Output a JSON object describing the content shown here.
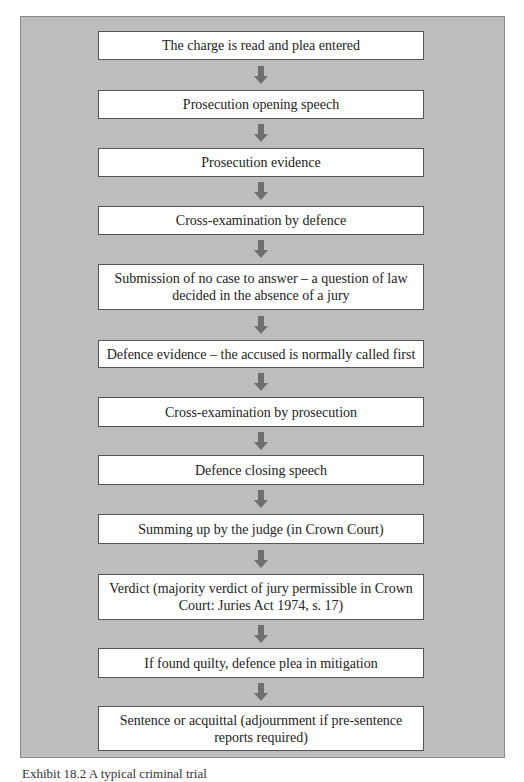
{
  "diagram": {
    "type": "flowchart",
    "direction": "top-to-bottom",
    "colors": {
      "panel_background": "#bdbdbd",
      "box_background": "#ffffff",
      "box_border": "#555555",
      "arrow": "#6f6f6f",
      "text": "#222222"
    },
    "steps": [
      {
        "label": "The charge is read and plea entered"
      },
      {
        "label": "Prosecution opening speech"
      },
      {
        "label": "Prosecution evidence"
      },
      {
        "label": "Cross-examination by defence"
      },
      {
        "label": "Submission of no case to answer – a question of law decided in the absence of a jury"
      },
      {
        "label": "Defence evidence – the accused is normally called first"
      },
      {
        "label": "Cross-examination by prosecution"
      },
      {
        "label": "Defence closing speech"
      },
      {
        "label": "Summing up by the judge (in Crown Court)"
      },
      {
        "label": "Verdict (majority verdict of jury permissible in Crown Court: Juries Act 1974, s. 17)"
      },
      {
        "label": "If found quilty, defence plea in mitigation"
      },
      {
        "label": "Sentence or acquittal (adjournment if pre-sentence reports required)"
      }
    ],
    "arrows": [
      {
        "from": 0,
        "to": 1
      },
      {
        "from": 1,
        "to": 2
      },
      {
        "from": 2,
        "to": 3
      },
      {
        "from": 3,
        "to": 4
      },
      {
        "from": 4,
        "to": 5
      },
      {
        "from": 5,
        "to": 6
      },
      {
        "from": 6,
        "to": 7
      },
      {
        "from": 7,
        "to": 8
      },
      {
        "from": 8,
        "to": 9
      },
      {
        "from": 9,
        "to": 10
      },
      {
        "from": 10,
        "to": 11
      }
    ]
  },
  "caption": {
    "text": "Exhibit 18.2  A typical criminal trial"
  }
}
